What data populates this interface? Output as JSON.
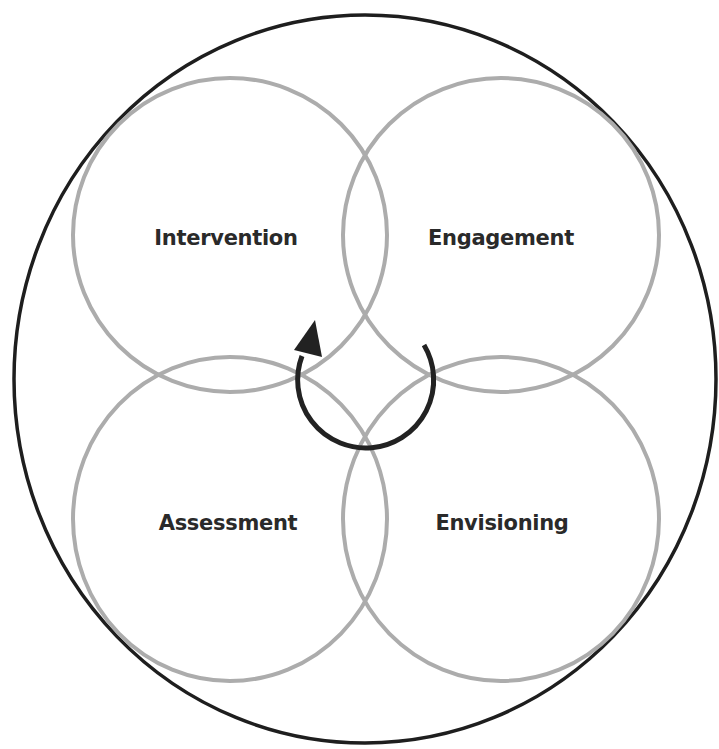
{
  "diagram": {
    "type": "cyclical-venn",
    "colors": {
      "outer_ring": "#1e1e1e",
      "phase_circles": "#acacac",
      "arrow": "#222222",
      "label_text": "#2a2a2a",
      "background": "#ffffff"
    },
    "phases": [
      {
        "label": "Intervention",
        "position": "top-left"
      },
      {
        "label": "Engagement",
        "position": "top-right"
      },
      {
        "label": "Assessment",
        "position": "bottom-left"
      },
      {
        "label": "Envisioning",
        "position": "bottom-right"
      }
    ],
    "center_arrow": {
      "icon": "circular-arrow-icon",
      "direction": "clockwise-cycle"
    }
  }
}
